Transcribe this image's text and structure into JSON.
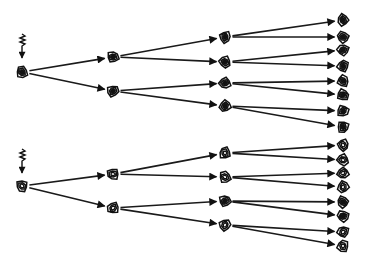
{
  "diagram": {
    "type": "lineage-tree",
    "colors": {
      "ink": "#111111",
      "background": "#ffffff"
    },
    "trees": [
      {
        "name": "top-tree",
        "signal_icon": "squiggle-arrow-icon",
        "signal_pos": [
          22,
          40
        ],
        "generations": [
          {
            "x": 22,
            "nodes": [
              {
                "y": 72,
                "state": "dark"
              }
            ]
          },
          {
            "x": 113,
            "nodes": [
              {
                "y": 57,
                "state": "dark"
              },
              {
                "y": 91,
                "state": "dark"
              }
            ]
          },
          {
            "x": 225,
            "nodes": [
              {
                "y": 37,
                "state": "dark"
              },
              {
                "y": 62,
                "state": "dark"
              },
              {
                "y": 83,
                "state": "dark"
              },
              {
                "y": 106,
                "state": "dark"
              }
            ]
          },
          {
            "x": 343,
            "nodes": [
              {
                "y": 20,
                "state": "dark"
              },
              {
                "y": 37,
                "state": "dark"
              },
              {
                "y": 50,
                "state": "dark"
              },
              {
                "y": 66,
                "state": "dark"
              },
              {
                "y": 81,
                "state": "dark"
              },
              {
                "y": 95,
                "state": "dark"
              },
              {
                "y": 111,
                "state": "dark"
              },
              {
                "y": 127,
                "state": "dark"
              }
            ]
          }
        ]
      },
      {
        "name": "bottom-tree",
        "signal_icon": "squiggle-arrow-icon",
        "signal_pos": [
          22,
          155
        ],
        "generations": [
          {
            "x": 22,
            "nodes": [
              {
                "y": 186,
                "state": "light"
              }
            ]
          },
          {
            "x": 113,
            "nodes": [
              {
                "y": 174,
                "state": "light"
              },
              {
                "y": 208,
                "state": "light"
              }
            ]
          },
          {
            "x": 225,
            "nodes": [
              {
                "y": 153,
                "state": "light"
              },
              {
                "y": 177,
                "state": "light"
              },
              {
                "y": 201,
                "state": "dark"
              },
              {
                "y": 225,
                "state": "light"
              }
            ]
          },
          {
            "x": 343,
            "nodes": [
              {
                "y": 145,
                "state": "light"
              },
              {
                "y": 160,
                "state": "light"
              },
              {
                "y": 173,
                "state": "light"
              },
              {
                "y": 187,
                "state": "light"
              },
              {
                "y": 202,
                "state": "dark"
              },
              {
                "y": 216,
                "state": "dark"
              },
              {
                "y": 232,
                "state": "light"
              },
              {
                "y": 246,
                "state": "light"
              }
            ]
          }
        ]
      }
    ]
  }
}
